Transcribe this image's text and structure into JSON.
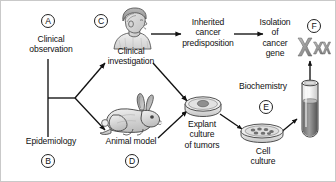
{
  "figure": {
    "background": "#ffffff",
    "ink": "#111111"
  },
  "nodes": {
    "clinical_observation": {
      "key": "A",
      "label": "Clinical\nobservation"
    },
    "epidemiology": {
      "key": "B",
      "label": "Epidemiology"
    },
    "clinical_investigation": {
      "key": "C",
      "label": "Clinical\ninvestigation",
      "icon": "human-bust-icon"
    },
    "animal_model": {
      "key": "D",
      "label": "Animal model",
      "icon": "rabbit-icon"
    },
    "inherited_predisposition": {
      "key": "",
      "label": "Inherited\ncancer\npredisposition"
    },
    "isolation_of_gene": {
      "key": "F",
      "label": "Isolation\nof\ncancer\ngene",
      "icon": "chromosomes-icon"
    },
    "explant_culture": {
      "key": "",
      "label": "Explant\nculture\nof tumors",
      "icon": "petri-dish-tumor-icon"
    },
    "cell_culture": {
      "key": "E",
      "label": "Cell\nculture",
      "icon": "petri-dish-cells-icon"
    },
    "biochemistry": {
      "key": "",
      "label": "Biochemistry",
      "icon": "test-tube-icon"
    }
  },
  "edges": [
    {
      "from": "clinical_observation",
      "to": "branch",
      "style": "line"
    },
    {
      "from": "epidemiology",
      "to": "branch",
      "style": "line"
    },
    {
      "from": "branch",
      "to": "clinical_investigation",
      "style": "arrow"
    },
    {
      "from": "branch",
      "to": "animal_model",
      "style": "arrow"
    },
    {
      "from": "clinical_investigation",
      "to": "inherited_predisposition",
      "style": "arrow"
    },
    {
      "from": "inherited_predisposition",
      "to": "isolation_of_gene",
      "style": "arrow"
    },
    {
      "from": "clinical_investigation",
      "to": "explant_culture",
      "style": "arrow"
    },
    {
      "from": "animal_model",
      "to": "explant_culture",
      "style": "arrow"
    },
    {
      "from": "explant_culture",
      "to": "cell_culture",
      "style": "arrow"
    },
    {
      "from": "cell_culture",
      "to": "biochemistry",
      "style": "arrow"
    },
    {
      "from": "biochemistry",
      "to": "isolation_of_gene",
      "style": "arrow"
    }
  ]
}
